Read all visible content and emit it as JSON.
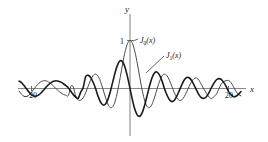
{
  "figure": {
    "name": "bessel-functions-plot",
    "background_color": "#ffffff"
  },
  "axes": {
    "y_axis_label": "y",
    "x_axis_label": "x",
    "y_tick_label": "1",
    "x_tick_left_label": "20",
    "x_tick_left_sign": "–",
    "x_tick_right_label": "20",
    "axis_color": "#8a8a8a"
  },
  "curves": {
    "j0": {
      "label_base": "J",
      "label_sub": "0",
      "label_arg": "(x)",
      "color": "#4a4a4a"
    },
    "j1": {
      "label_base": "J",
      "label_sub": "1",
      "label_arg": "(x)",
      "color": "#1b1b1b"
    }
  },
  "chart_data": {
    "type": "line",
    "title": "",
    "xlabel": "x",
    "ylabel": "y",
    "xlim": [
      -22.5,
      22.5
    ],
    "ylim": [
      -0.72,
      1.12
    ],
    "grid": false,
    "legend": "inline-annotations",
    "xticks": [
      -20,
      20
    ],
    "xtick_labels": [
      "–20",
      "20"
    ],
    "yticks": [
      1
    ],
    "ytick_labels": [
      "1"
    ],
    "annotations": [
      {
        "text": "J0(x)",
        "x": 1.9,
        "y": 1.0
      },
      {
        "text": "J1(x)",
        "x": 7.0,
        "y": 0.72
      }
    ],
    "series": [
      {
        "name": "J0(x)",
        "color": "#4a4a4a",
        "x": [
          -22.5,
          -22,
          -21.5,
          -21,
          -20.5,
          -20,
          -19.5,
          -19,
          -18.5,
          -18,
          -17.5,
          -17,
          -16.5,
          -16,
          -15.5,
          -15,
          -14.5,
          -14,
          -13.5,
          -13,
          -12.5,
          -12,
          -11.5,
          -11,
          -10.5,
          -10,
          -9.5,
          -9,
          -8.5,
          -8,
          -7.5,
          -7,
          -6.5,
          -6,
          -5.5,
          -5,
          -4.5,
          -4,
          -3.5,
          -3,
          -2.5,
          -2,
          -1.5,
          -1,
          -0.5,
          0,
          0.5,
          1,
          1.5,
          2,
          2.5,
          3,
          3.5,
          4,
          4.5,
          5,
          5.5,
          6,
          6.5,
          7,
          7.5,
          8,
          8.5,
          9,
          9.5,
          10,
          10.5,
          11,
          11.5,
          12,
          12.5,
          13,
          13.5,
          14,
          14.5,
          15,
          15.5,
          16,
          16.5,
          17,
          17.5,
          18,
          18.5,
          19,
          19.5,
          20,
          20.5,
          21,
          21.5,
          22,
          22.5
        ],
        "y": [
          -0.052,
          -0.121,
          -0.162,
          -0.167,
          -0.137,
          -0.082,
          -0.014,
          0.053,
          0.108,
          0.146,
          0.162,
          0.158,
          0.135,
          0.097,
          0.049,
          -0.002,
          -0.051,
          -0.093,
          -0.124,
          -0.142,
          -0.147,
          0.047,
          0.032,
          -0.171,
          -0.237,
          -0.246,
          -0.194,
          -0.09,
          0.042,
          0.172,
          0.266,
          0.3,
          0.26,
          0.151,
          -0.006,
          -0.178,
          -0.321,
          -0.397,
          -0.38,
          -0.26,
          -0.048,
          0.224,
          0.512,
          0.765,
          0.938,
          1.0,
          0.938,
          0.765,
          0.512,
          0.224,
          -0.048,
          -0.26,
          -0.38,
          -0.397,
          -0.321,
          -0.178,
          -0.006,
          0.151,
          0.26,
          0.3,
          0.266,
          0.172,
          0.042,
          -0.09,
          -0.194,
          -0.246,
          -0.237,
          -0.171,
          -0.068,
          0.047,
          0.146,
          0.207,
          0.219,
          0.171,
          0.079,
          -0.014,
          -0.102,
          -0.175,
          -0.211,
          -0.17,
          -0.124,
          -0.013,
          0.093,
          0.146,
          0.162,
          0.167,
          0.121,
          0.036,
          -0.057,
          -0.121,
          -0.152
        ]
      },
      {
        "name": "J1(x)",
        "color": "#1b1b1b",
        "x": [
          -22.5,
          -22,
          -21.5,
          -21,
          -20.5,
          -20,
          -19.5,
          -19,
          -18.5,
          -18,
          -17.5,
          -17,
          -16.5,
          -16,
          -15.5,
          -15,
          -14.5,
          -14,
          -13.5,
          -13,
          -12.5,
          -12,
          -11.5,
          -11,
          -10.5,
          -10,
          -9.5,
          -9,
          -8.5,
          -8,
          -7.5,
          -7,
          -6.5,
          -6,
          -5.5,
          -5,
          -4.5,
          -4,
          -3.5,
          -3,
          -2.5,
          -2,
          -1.5,
          -1,
          -0.5,
          0,
          0.5,
          1,
          1.5,
          2,
          2.5,
          3,
          3.5,
          4,
          4.5,
          5,
          5.5,
          6,
          6.5,
          7,
          7.5,
          8,
          8.5,
          9,
          9.5,
          10,
          10.5,
          11,
          11.5,
          12,
          12.5,
          13,
          13.5,
          14,
          14.5,
          15,
          15.5,
          16,
          16.5,
          17,
          17.5,
          18,
          18.5,
          19,
          19.5,
          20,
          20.5,
          21,
          21.5,
          22,
          22.5
        ],
        "y": [
          0.155,
          0.122,
          0.062,
          -0.007,
          -0.073,
          -0.13,
          -0.157,
          -0.158,
          -0.133,
          -0.088,
          -0.03,
          0.03,
          0.083,
          0.124,
          0.15,
          0.161,
          0.152,
          0.133,
          0.099,
          0.059,
          0.012,
          -0.057,
          -0.128,
          -0.177,
          -0.204,
          -0.077,
          0.021,
          0.245,
          0.273,
          0.235,
          0.135,
          0.005,
          -0.154,
          -0.277,
          -0.341,
          -0.328,
          -0.231,
          -0.066,
          0.137,
          0.339,
          0.497,
          0.577,
          0.558,
          0.44,
          0.242,
          0.0,
          -0.242,
          -0.44,
          -0.558,
          -0.577,
          -0.497,
          -0.339,
          -0.137,
          0.066,
          0.231,
          0.328,
          0.341,
          0.277,
          0.154,
          -0.005,
          -0.135,
          -0.235,
          -0.273,
          -0.245,
          -0.161,
          -0.043,
          0.077,
          0.177,
          0.228,
          0.223,
          0.166,
          0.07,
          -0.036,
          -0.133,
          -0.193,
          -0.205,
          -0.17,
          -0.09,
          0.013,
          0.108,
          0.178,
          0.205,
          0.188,
          0.128,
          0.043,
          -0.066,
          -0.13,
          -0.171,
          -0.161,
          -0.122,
          -0.062
        ]
      }
    ]
  }
}
